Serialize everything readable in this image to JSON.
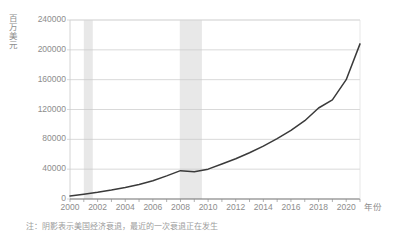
{
  "chart_data": {
    "type": "line",
    "title": "",
    "xlabel": "年份",
    "ylabel": "百万美元",
    "xlim": [
      2000,
      2021
    ],
    "ylim": [
      0,
      240000
    ],
    "grid": true,
    "legend_position": "none",
    "xticks": [
      2000,
      2002,
      2004,
      2006,
      2008,
      2010,
      2012,
      2014,
      2016,
      2018,
      2020
    ],
    "yticks": [
      0,
      40000,
      80000,
      120000,
      160000,
      200000,
      240000
    ],
    "series": [
      {
        "name": "值",
        "color": "#3a3a3a",
        "x": [
          2000,
          2001,
          2002,
          2003,
          2004,
          2005,
          2006,
          2007,
          2008,
          2009,
          2010,
          2011,
          2012,
          2013,
          2014,
          2015,
          2016,
          2017,
          2018,
          2019,
          2020,
          2021
        ],
        "values": [
          4000,
          6500,
          9000,
          12000,
          15500,
          19500,
          24500,
          31000,
          38000,
          36500,
          40000,
          47000,
          54000,
          62000,
          71000,
          81000,
          92000,
          105000,
          122000,
          133000,
          160000,
          208000
        ]
      }
    ],
    "shaded_regions": [
      {
        "name": "衰退-2001",
        "start": 2001.0,
        "end": 2001.65,
        "color": "#e8e8e8"
      },
      {
        "name": "衰退-2008",
        "start": 2007.95,
        "end": 2009.55,
        "color": "#e8e8e8"
      }
    ],
    "note": "注：阴影表示美国经济衰退，最近的一次衰退正在发生"
  },
  "axis": {
    "y_unit_label": "百万美元",
    "x_unit_label": "年份",
    "y_tick_labels": [
      "240000",
      "200000",
      "160000",
      "120000",
      "80000",
      "40000",
      "0"
    ],
    "x_tick_labels": [
      "2000",
      "2002",
      "2004",
      "2006",
      "2008",
      "2010",
      "2012",
      "2014",
      "2016",
      "2018",
      "2020"
    ]
  },
  "footnote": {
    "text": "注：阴影表示美国经济衰退，最近的一次衰退正在发生"
  },
  "colors": {
    "line": "#3a3a3a",
    "grid": "#c9c9c9",
    "shade": "#e8e8e8",
    "text": "#8d8d8d"
  }
}
